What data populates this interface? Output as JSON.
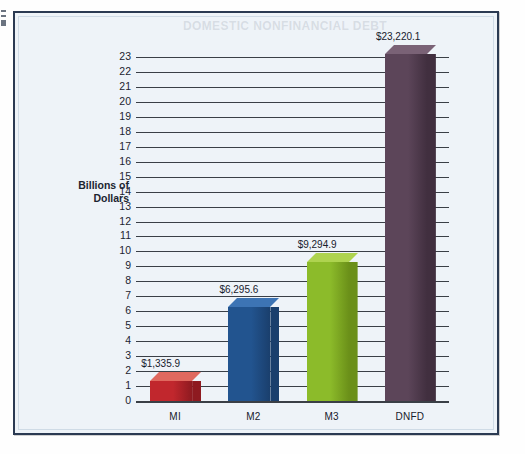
{
  "panel": {
    "ghost_text": "DOMESTIC NONFINANCIAL DEBT"
  },
  "chart_data": {
    "type": "bar",
    "title": "",
    "xlabel": "",
    "ylabel": "Billions of\nDollars",
    "ylabel_line1": "Billions of",
    "ylabel_line2": "Dollars",
    "categories": [
      "MI",
      "M2",
      "M3",
      "DNFD"
    ],
    "values": [
      1335.9,
      6295.6,
      9294.9,
      23220.1
    ],
    "plot_values": [
      1.3359,
      6.2956,
      9.2949,
      23.2201
    ],
    "data_labels": [
      "$1,335.9",
      "$6,295.6",
      "$9,294.9",
      "$23,220.1"
    ],
    "units": "Billions of Dollars",
    "ylim": [
      0,
      23
    ],
    "ytick_step": 1,
    "yticks": [
      "23",
      "22",
      "21",
      "20",
      "19",
      "18",
      "17",
      "16",
      "15",
      "14",
      "13",
      "12",
      "11",
      "10",
      "9",
      "8",
      "7",
      "6",
      "5",
      "4",
      "3",
      "2",
      "1",
      "0"
    ],
    "grid": true,
    "legend": "none",
    "series_colors": [
      "#c1272d",
      "#22548f",
      "#8cbb2a",
      "#5c4559"
    ],
    "series_top_colors": [
      "#e0695f",
      "#3d74b4",
      "#aed34f",
      "#7a6276"
    ],
    "series_side_colors": [
      "#8e1a20",
      "#1a3f6d",
      "#6b9019",
      "#412f3f"
    ]
  },
  "style": {
    "panel_bg": "#eef3f8",
    "panel_border": "#2b3a52",
    "grid_color": "#3a3f46",
    "text_color": "#1b2430"
  }
}
